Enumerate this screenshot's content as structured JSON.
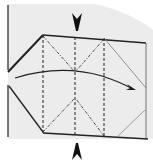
{
  "diagram": {
    "type": "origami-fold-instruction",
    "colors": {
      "background": "#ffffff",
      "paper_shade": "#ececec",
      "line": "#222222",
      "thin_line": "#666666"
    },
    "elements": {
      "top_arrow": {
        "label": "push-in arrow (top)",
        "direction": "down"
      },
      "bottom_arrow": {
        "label": "push-in arrow (bottom)",
        "direction": "up"
      },
      "curved_arrow": {
        "label": "fold-over arrow",
        "direction": "right"
      },
      "valley_folds": {
        "label": "valley fold lines (dashed)",
        "count": 3
      },
      "mountain_folds": {
        "label": "diagonal fold lines (dash-dot)",
        "count": 4
      }
    }
  }
}
